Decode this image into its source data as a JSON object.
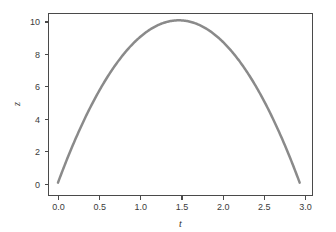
{
  "chart_data": {
    "type": "line",
    "title": "",
    "subtitle": "",
    "xlabel": "t",
    "ylabel": "z",
    "xlim": [
      -0.12,
      3.06
    ],
    "ylim": [
      -0.85,
      10.75
    ],
    "grid": false,
    "legend": null,
    "series": [
      {
        "name": "z(t)",
        "color": "#8a8a8a",
        "linewidth": 2.5,
        "x": [
          0.0,
          0.1,
          0.2,
          0.3,
          0.4,
          0.5,
          0.6,
          0.7,
          0.8,
          0.9,
          1.0,
          1.1,
          1.2,
          1.3,
          1.4,
          1.45,
          1.5,
          1.6,
          1.7,
          1.8,
          1.9,
          2.0,
          2.1,
          2.2,
          2.3,
          2.4,
          2.5,
          2.6,
          2.7,
          2.8,
          2.9
        ],
        "y": [
          0.0,
          1.37,
          2.64,
          3.82,
          4.9,
          5.88,
          6.76,
          7.54,
          8.22,
          8.81,
          9.3,
          9.69,
          9.99,
          10.18,
          10.28,
          10.29,
          10.28,
          10.2,
          9.9,
          9.6,
          9.29,
          8.78,
          8.22,
          7.56,
          6.8,
          5.94,
          4.99,
          5.0,
          3.0,
          1.32,
          -0.33
        ]
      }
    ],
    "curve_equation": "z = 14.2*t - 4.9*t^2",
    "peak": {
      "t": 1.45,
      "z": 10.29
    },
    "xticks": [
      0.0,
      0.5,
      1.0,
      1.5,
      2.0,
      2.5,
      3.0
    ],
    "xtick_labels": [
      "0.0",
      "0.5",
      "1.0",
      "1.5",
      "2.0",
      "2.5",
      "3.0"
    ],
    "yticks": [
      0,
      2,
      4,
      6,
      8,
      10
    ],
    "ytick_labels": [
      "0",
      "2",
      "4",
      "6",
      "8",
      "10"
    ],
    "frame": {
      "left": 48,
      "right": 313,
      "top": 13,
      "bottom": 196
    },
    "colors": {
      "curve": "#8a8a8a",
      "axis": "#4a4a4a",
      "text": "#3b3b3b",
      "background": "#ffffff"
    }
  }
}
